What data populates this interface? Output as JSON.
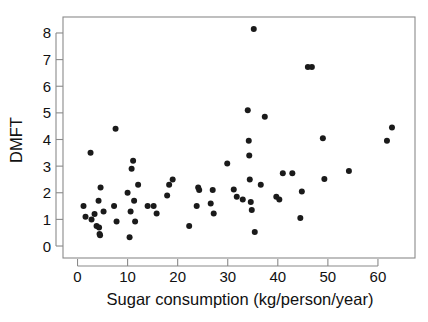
{
  "chart_data": {
    "type": "scatter",
    "title": "",
    "xlabel": "Sugar consumption (kg/person/year)",
    "ylabel": "DMFT",
    "xlim": [
      -2.9,
      67.4
    ],
    "ylim": [
      -0.45,
      8.6
    ],
    "xticks": [
      0,
      10,
      20,
      30,
      40,
      50,
      60
    ],
    "xticklabels": [
      "0",
      "10",
      "20",
      "30",
      "40",
      "50",
      "60"
    ],
    "yticks": [
      0,
      1,
      2,
      3,
      4,
      5,
      6,
      7,
      8
    ],
    "yticklabels": [
      "0",
      "1",
      "2",
      "3",
      "4",
      "5",
      "6",
      "7",
      "8"
    ],
    "grid": false,
    "legend": null,
    "marker": "filled-circle",
    "marker_color": "#1a1a1a",
    "marker_size_px": 3.0,
    "frame_color": "#8a8a8a",
    "background": "#ffffff",
    "n_points": 72,
    "series": [
      {
        "name": "countries",
        "points": [
          [
            1.2,
            1.5
          ],
          [
            1.6,
            1.1
          ],
          [
            2.6,
            3.5
          ],
          [
            2.8,
            1.0
          ],
          [
            3.4,
            1.2
          ],
          [
            3.8,
            0.75
          ],
          [
            4.2,
            1.7
          ],
          [
            4.3,
            0.7
          ],
          [
            4.4,
            0.45
          ],
          [
            4.5,
            0.4
          ],
          [
            4.6,
            2.2
          ],
          [
            5.2,
            1.3
          ],
          [
            7.3,
            1.5
          ],
          [
            7.6,
            4.4
          ],
          [
            7.8,
            0.92
          ],
          [
            10.0,
            2.0
          ],
          [
            10.4,
            0.33
          ],
          [
            10.6,
            1.3
          ],
          [
            10.8,
            2.9
          ],
          [
            11.1,
            3.2
          ],
          [
            11.3,
            1.7
          ],
          [
            11.5,
            0.92
          ],
          [
            12.1,
            2.3
          ],
          [
            14.0,
            1.5
          ],
          [
            15.2,
            1.5
          ],
          [
            15.8,
            1.22
          ],
          [
            17.9,
            1.9
          ],
          [
            18.3,
            2.3
          ],
          [
            19.0,
            2.5
          ],
          [
            22.3,
            0.75
          ],
          [
            23.8,
            1.5
          ],
          [
            24.1,
            2.2
          ],
          [
            24.3,
            2.1
          ],
          [
            26.6,
            1.6
          ],
          [
            27.0,
            2.1
          ],
          [
            27.2,
            1.22
          ],
          [
            29.9,
            3.1
          ],
          [
            31.2,
            2.12
          ],
          [
            31.8,
            1.85
          ],
          [
            33.0,
            1.75
          ],
          [
            34.0,
            5.1
          ],
          [
            34.2,
            3.95
          ],
          [
            34.3,
            3.4
          ],
          [
            34.4,
            2.5
          ],
          [
            34.6,
            1.65
          ],
          [
            34.8,
            1.35
          ],
          [
            35.2,
            8.15
          ],
          [
            35.4,
            0.53
          ],
          [
            36.6,
            2.3
          ],
          [
            37.4,
            4.85
          ],
          [
            39.7,
            1.85
          ],
          [
            40.3,
            1.75
          ],
          [
            41.0,
            2.73
          ],
          [
            42.9,
            2.73
          ],
          [
            44.5,
            1.05
          ],
          [
            44.8,
            2.05
          ],
          [
            46.0,
            6.72
          ],
          [
            46.8,
            6.72
          ],
          [
            49.0,
            4.05
          ],
          [
            49.3,
            2.52
          ],
          [
            54.2,
            2.82
          ],
          [
            61.8,
            3.95
          ],
          [
            62.8,
            4.45
          ]
        ]
      }
    ]
  },
  "labels": {
    "xtitle": "Sugar consumption (kg/person/year)",
    "ytitle": "DMFT"
  }
}
